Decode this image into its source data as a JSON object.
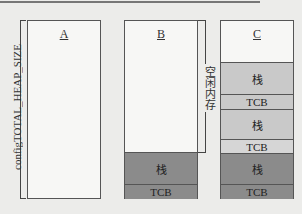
{
  "diagram": {
    "heap_label": "configTOTAL_HEAP_SIZE",
    "free_memory_label": "空闲内存",
    "boxes": [
      {
        "title": "A"
      },
      {
        "title": "B",
        "segments": [
          {
            "label": "栈"
          },
          {
            "label": "TCB"
          }
        ]
      },
      {
        "title": "C",
        "segments": [
          {
            "label": "栈"
          },
          {
            "label": "TCB"
          },
          {
            "label": "栈"
          },
          {
            "label": "TCB"
          },
          {
            "label": "栈"
          },
          {
            "label": "TCB"
          }
        ]
      }
    ],
    "colors": {
      "free": "#f7f7f5",
      "light_block": "#c9c9c9",
      "dark_block": "#8b8b8b"
    }
  }
}
